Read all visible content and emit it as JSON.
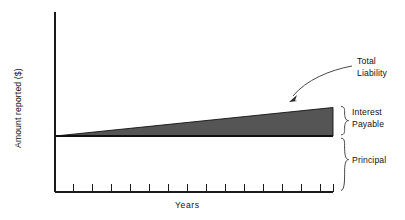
{
  "figure": {
    "background_color": "#ffffff",
    "ink_color": "#111111",
    "wedge_color": "#555555",
    "leader_color": "#4a4a4a"
  },
  "axes": {
    "y_axis_label": "Amount reported ($)",
    "x_axis_label": "Years",
    "x_tick_count": 15,
    "y_tick_count": 0,
    "grid": "off"
  },
  "annotations": {
    "callout": {
      "line1": "Total",
      "line2": "Liability",
      "icon": "curved-arrow-icon"
    },
    "bracket_upper": {
      "line1": "Interest",
      "line2": "Payable",
      "icon": "curly-brace-icon"
    },
    "bracket_lower": {
      "line1": "Principal",
      "icon": "curly-brace-icon"
    }
  },
  "chart_data": {
    "type": "area",
    "title": "",
    "subtitle": "",
    "xlabel": "Years",
    "ylabel": "Amount reported ($)",
    "xlim": [
      0,
      15
    ],
    "ylim": [
      0,
      100
    ],
    "grid": false,
    "legend": "none",
    "annotations": [
      {
        "text": "Total Liability",
        "target": "top edge of shaded wedge near right end",
        "style": "curved arrow"
      },
      {
        "text": "Interest Payable",
        "target": "wedge thickness at right edge",
        "style": "curly brace"
      },
      {
        "text": "Principal",
        "target": "region from baseline down to x-axis",
        "style": "curly brace"
      }
    ],
    "categories": [
      "0",
      "1",
      "2",
      "3",
      "4",
      "5",
      "6",
      "7",
      "8",
      "9",
      "10",
      "11",
      "12",
      "13",
      "14",
      "15"
    ],
    "series": [
      {
        "name": "Principal",
        "stacked": true,
        "fill": "none",
        "values": [
          38,
          38,
          38,
          38,
          38,
          38,
          38,
          38,
          38,
          38,
          38,
          38,
          38,
          38,
          38,
          38
        ]
      },
      {
        "name": "Interest Payable",
        "stacked": true,
        "fill": "#555555",
        "values": [
          0.0,
          1.1,
          2.2,
          3.2,
          4.3,
          5.4,
          6.5,
          7.6,
          8.6,
          9.7,
          10.8,
          11.9,
          13.0,
          14.0,
          15.1,
          16.2
        ]
      }
    ],
    "total_liability": [
      38.0,
      39.1,
      40.2,
      41.2,
      42.3,
      43.4,
      44.5,
      45.6,
      46.6,
      47.7,
      48.8,
      49.9,
      51.0,
      52.0,
      53.1,
      54.2
    ]
  }
}
